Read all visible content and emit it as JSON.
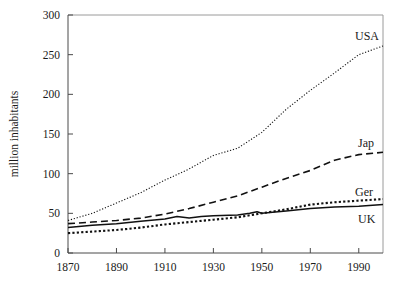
{
  "chart_data": {
    "type": "line",
    "title": "",
    "xlabel": "",
    "ylabel": "million inhabitants",
    "xlim": [
      1870,
      2000
    ],
    "ylim": [
      0,
      300
    ],
    "xticks": [
      1870,
      1890,
      1910,
      1930,
      1950,
      1970,
      1990
    ],
    "xtick_labels": [
      "1870",
      "1890",
      "1910",
      "1930",
      "1950",
      "1970",
      "1990"
    ],
    "yticks": [
      0,
      50,
      100,
      150,
      200,
      250,
      300
    ],
    "ytick_labels": [
      "0",
      "50",
      "100",
      "150",
      "200",
      "250",
      "300"
    ],
    "grid": false,
    "legend_position": "inline-right-of-line-ends",
    "series": [
      {
        "name": "USA",
        "label": "USA",
        "style": "dotted",
        "color": "#111111",
        "x": [
          1870,
          1880,
          1890,
          1900,
          1910,
          1920,
          1930,
          1940,
          1950,
          1960,
          1970,
          1980,
          1990,
          2000
        ],
        "values": [
          41,
          50,
          63,
          76,
          92,
          106,
          123,
          132,
          152,
          181,
          205,
          227,
          250,
          261
        ]
      },
      {
        "name": "Jap",
        "label": "Jap",
        "style": "dashed",
        "color": "#111111",
        "x": [
          1870,
          1880,
          1890,
          1900,
          1910,
          1920,
          1930,
          1940,
          1950,
          1960,
          1970,
          1980,
          1990,
          2000
        ],
        "values": [
          37,
          39,
          41,
          44,
          49,
          56,
          64,
          72,
          83,
          94,
          104,
          117,
          124,
          127
        ]
      },
      {
        "name": "Ger",
        "label": "Ger",
        "style": "dotted-thick",
        "color": "#111111",
        "x": [
          1870,
          1880,
          1890,
          1900,
          1910,
          1920,
          1930,
          1940,
          1950,
          1960,
          1970,
          1980,
          1990,
          2000
        ],
        "values": [
          25,
          27,
          29,
          32,
          36,
          39,
          42,
          45,
          50,
          55,
          61,
          64,
          66,
          68
        ]
      },
      {
        "name": "UK",
        "label": "UK",
        "style": "solid",
        "color": "#111111",
        "x": [
          1870,
          1880,
          1890,
          1900,
          1910,
          1915,
          1920,
          1925,
          1930,
          1940,
          1945,
          1948,
          1950,
          1960,
          1970,
          1980,
          1990,
          2000
        ],
        "values": [
          32,
          35,
          37,
          40,
          43,
          46,
          44,
          46,
          47,
          48,
          50,
          52,
          50,
          53,
          56,
          58,
          59,
          61
        ]
      }
    ],
    "series_label_positions": [
      {
        "name": "USA",
        "x": 355,
        "y": 40
      },
      {
        "name": "Jap",
        "x": 358,
        "y": 147
      },
      {
        "name": "Ger",
        "x": 355,
        "y": 196
      },
      {
        "name": "UK",
        "x": 358,
        "y": 223
      }
    ]
  }
}
